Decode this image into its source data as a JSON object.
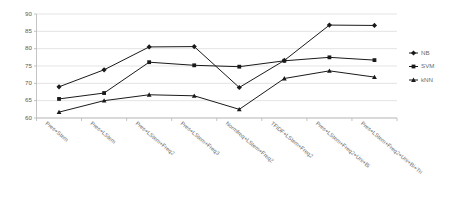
{
  "chart_data": {
    "type": "line",
    "title": "",
    "xlabel": "",
    "ylabel": "",
    "ylim": [
      60,
      90
    ],
    "yticks": [
      60,
      65,
      70,
      75,
      80,
      85,
      90
    ],
    "grid": true,
    "legend_position": "right",
    "categories": [
      "Pres+Stem",
      "Pres+LStem",
      "Pres+LStem+Freq2",
      "Pres+LStem+Freq3",
      "Normfreq+LStem+Freq2",
      "TFIDF+LStem+Freq2",
      "Pres+LStem+Freq2+Uni+Bi",
      "Pres+LStem+Freq2+Uni+Bi+Tri"
    ],
    "series": [
      {
        "name": "NB",
        "marker": "diamond",
        "color": "#1a1a1a",
        "values": [
          69.0,
          73.9,
          80.5,
          80.6,
          68.8,
          76.6,
          86.8,
          86.7
        ]
      },
      {
        "name": "SVM",
        "marker": "square",
        "color": "#1a1a1a",
        "values": [
          65.5,
          67.2,
          76.1,
          75.2,
          74.8,
          76.5,
          77.5,
          76.7
        ]
      },
      {
        "name": "kNN",
        "marker": "triangle",
        "color": "#1a1a1a",
        "values": [
          61.7,
          65.0,
          66.7,
          66.4,
          62.5,
          71.4,
          73.6,
          71.8
        ]
      }
    ]
  },
  "legend": {
    "entries": [
      {
        "label": "NB"
      },
      {
        "label": "SVM"
      },
      {
        "label": "kNN"
      }
    ]
  }
}
